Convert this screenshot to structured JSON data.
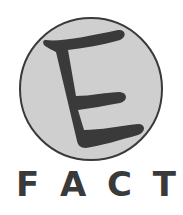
{
  "logo": {
    "emblem_letter": "E",
    "caption_letters": [
      "F",
      "A",
      "C",
      "T"
    ],
    "colors": {
      "circle_fill": "#cfcfcf",
      "circle_stroke": "#3a3a3a",
      "letter": "#3a3a3a",
      "background": "#ffffff"
    }
  }
}
